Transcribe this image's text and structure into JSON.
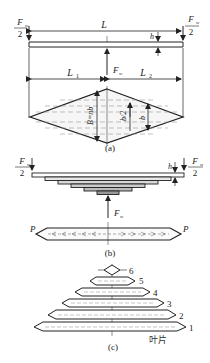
{
  "figure": {
    "type": "leaf-spring-diagram",
    "panels": [
      {
        "id": "a",
        "caption": "(a)"
      },
      {
        "id": "b",
        "caption": "(b)"
      },
      {
        "id": "c",
        "caption": "(c)"
      }
    ]
  },
  "panel_a": {
    "caption": "(a)",
    "span_label": "L",
    "left_label": "L",
    "left_sub": "1",
    "right_label": "L",
    "right_sub": "2",
    "center_force": "F",
    "center_force_sub": "w",
    "end_force_num": "F",
    "end_force_sub": "w",
    "end_force_den": "2",
    "thickness_label": "h",
    "width_label": "B=nb",
    "half_width_label": "b/2",
    "leaf_width_label": "b"
  },
  "panel_b": {
    "caption": "(b)",
    "end_force_num": "F",
    "end_force_sub": "w",
    "end_force_den": "2",
    "thickness_label": "h",
    "center_force": "F",
    "center_force_sub": "w",
    "tension_left": "P",
    "tension_right": "P"
  },
  "panel_c": {
    "caption": "(c)",
    "leaf_numbers": [
      "6",
      "5",
      "4",
      "3",
      "2",
      "1"
    ],
    "leaf_label": "叶片"
  },
  "colors": {
    "line": "#222222",
    "hatch": "#888888",
    "fill": "#f4f4f4"
  }
}
